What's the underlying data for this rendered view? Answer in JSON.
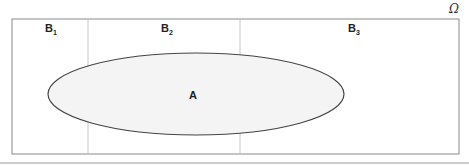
{
  "diagram": {
    "universe_label": "Ω",
    "partitions": [
      {
        "name": "B",
        "sub": "1"
      },
      {
        "name": "B",
        "sub": "2"
      },
      {
        "name": "B",
        "sub": "3"
      }
    ],
    "event_label": "A",
    "colors": {
      "frame": "#888888",
      "divider": "#bbbbbb",
      "ellipse_fill": "#f4f4f4",
      "ellipse_stroke": "#444444"
    }
  }
}
